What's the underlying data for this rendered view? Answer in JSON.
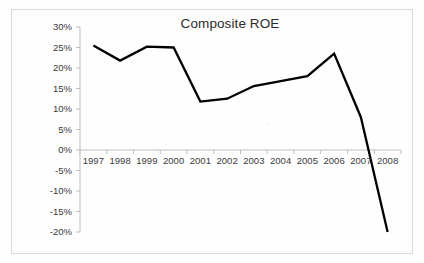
{
  "chart_data": {
    "type": "line",
    "title": "Composite ROE",
    "xlabel": "",
    "ylabel": "",
    "categories": [
      "1997",
      "1998",
      "1999",
      "2000",
      "2001",
      "2002",
      "2003",
      "2004",
      "2005",
      "2006",
      "2007",
      "2008"
    ],
    "values": [
      25.5,
      21.8,
      25.2,
      25.0,
      11.8,
      12.5,
      15.6,
      16.8,
      18.0,
      23.5,
      8.0,
      -20.0
    ],
    "value_labels": [
      "25.5%",
      "21.8%",
      "25.2%",
      "25.0%",
      "11.8%",
      "12.5%",
      "15.6%",
      "16.8%",
      "18.0%",
      "23.5%",
      "8.0%",
      "-20.0%"
    ],
    "ylim": [
      -20,
      30
    ],
    "ytick_values": [
      30,
      25,
      20,
      15,
      10,
      5,
      0,
      -5,
      -10,
      -15,
      -20
    ],
    "ytick_labels": [
      "30%",
      "25%",
      "20%",
      "15%",
      "10%",
      "5%",
      "0%",
      "-5%",
      "-10%",
      "-15%",
      "-20%"
    ],
    "grid": false,
    "legend": false,
    "legend_position": "none",
    "units": "percent",
    "series_name": "Composite ROE",
    "series_color": "#000000",
    "axis_color": "#bfbfbf",
    "text_color": "#3a3a3a",
    "plot_border_color": "#d9d9d9",
    "background_color": "#fefefe",
    "annotations": []
  }
}
